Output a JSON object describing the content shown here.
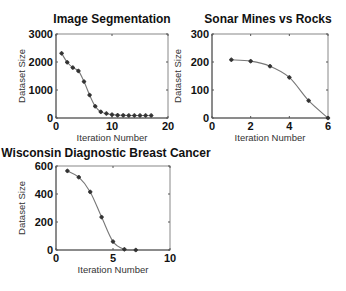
{
  "chart_data": [
    {
      "type": "line",
      "title": "Image Segmentation",
      "xlabel": "Iteration Number",
      "ylabel": "Dataset Size",
      "xlim": [
        0,
        20
      ],
      "ylim": [
        0,
        3000
      ],
      "xticks": [
        0,
        10,
        20
      ],
      "yticks": [
        0,
        1000,
        2000,
        3000
      ],
      "grid": false,
      "x": [
        1,
        2,
        3,
        4,
        5,
        6,
        7,
        8,
        9,
        10,
        11,
        12,
        13,
        14,
        15,
        16,
        17
      ],
      "values": [
        2310,
        1990,
        1800,
        1680,
        1300,
        820,
        420,
        220,
        160,
        120,
        100,
        95,
        90,
        90,
        90,
        90,
        90
      ]
    },
    {
      "type": "line",
      "title": "Sonar Mines vs Rocks",
      "xlabel": "Iteration Number",
      "ylabel": "Dataset Size",
      "xlim": [
        0,
        6
      ],
      "ylim": [
        0,
        300
      ],
      "xticks": [
        0,
        2,
        4,
        6
      ],
      "yticks": [
        0,
        100,
        200,
        300
      ],
      "grid": false,
      "x": [
        1,
        2,
        3,
        4,
        5,
        6
      ],
      "values": [
        208,
        203,
        185,
        145,
        62,
        0
      ]
    },
    {
      "type": "line",
      "title": "Wisconsin Diagnostic Breast Cancer",
      "xlabel": "Iteration Number",
      "ylabel": "Dataset Size",
      "xlim": [
        0,
        10
      ],
      "ylim": [
        0,
        600
      ],
      "xticks": [
        0,
        5,
        10
      ],
      "yticks": [
        0,
        200,
        400,
        600
      ],
      "grid": false,
      "x": [
        1,
        2,
        3,
        4,
        5,
        6,
        7
      ],
      "values": [
        565,
        520,
        415,
        235,
        60,
        5,
        0
      ]
    }
  ],
  "layout": [
    {
      "left": 56,
      "right": 168,
      "top": 34,
      "bottom": 118,
      "title_x": 112,
      "title_y": 23
    },
    {
      "left": 212,
      "right": 328,
      "top": 34,
      "bottom": 118,
      "title_x": 268,
      "title_y": 23
    },
    {
      "left": 56,
      "right": 170,
      "top": 166,
      "bottom": 250,
      "title_x": 106,
      "title_y": 157
    }
  ]
}
